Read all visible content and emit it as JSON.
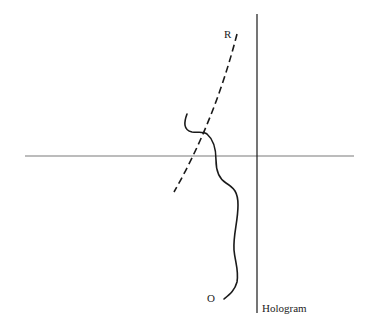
{
  "diagram": {
    "labels": {
      "reference_wave": "R",
      "object": "O",
      "hologram": "Hologram"
    },
    "elements": {
      "optical_axis": "horizontal axis line",
      "hologram_plane": "vertical line representing the hologram",
      "reference_wavefront": "dashed curve labeled R",
      "object_wavefront": "wavy solid curve labeled O"
    },
    "colors": {
      "axis": "#7a7a7a",
      "lines": "#1a1a1a",
      "text": "#222222"
    }
  }
}
